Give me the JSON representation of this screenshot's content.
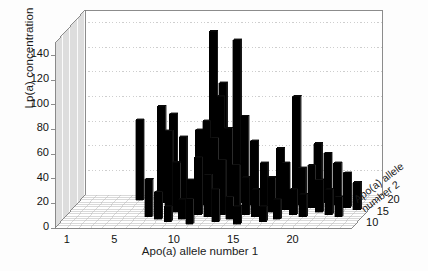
{
  "figure": {
    "type": "3d-bar-chart",
    "background": "#ffffff",
    "bar_color": "#000000",
    "bar_side_color": "#2b2b2b",
    "axis_color": "#808080",
    "grid_color": "#b9b9b9"
  },
  "axes": {
    "y_axis_label": "Lp(a) concentration",
    "x_axis_label": "Apo(a) allele number 1",
    "z_axis_label_line1": "Apo(a) allele",
    "z_axis_label_line2": "number 2",
    "y_ticks": [
      "0",
      "20",
      "40",
      "60",
      "80",
      "100",
      "120",
      "140"
    ],
    "x_ticks": [
      "1",
      "5",
      "10",
      "15",
      "20"
    ],
    "z_ticks": [
      "10",
      "15",
      "20"
    ]
  },
  "chart_data": {
    "type": "bar",
    "title": "",
    "xlabel": "Apo(a) allele number 1",
    "ylabel": "Lp(a) concentration",
    "zlabel": "Apo(a) allele number 2",
    "xlim": [
      0,
      25
    ],
    "ylim": [
      0,
      150
    ],
    "zlim": [
      8,
      22
    ],
    "xticks": [
      1,
      5,
      10,
      15,
      20
    ],
    "yticks": [
      0,
      20,
      40,
      60,
      80,
      100,
      120,
      140
    ],
    "zticks": [
      10,
      15,
      20
    ],
    "grid": true,
    "legend": null,
    "projection": "3d-bar3",
    "categories_x": [
      1,
      2,
      3,
      4,
      5,
      6,
      7,
      8,
      9,
      10,
      11,
      12,
      13,
      14,
      15,
      16,
      17,
      18,
      19,
      20,
      21,
      22,
      23,
      24
    ],
    "categories_z": [
      10,
      11,
      12,
      13,
      14,
      15,
      16,
      17,
      18,
      19,
      20,
      21,
      22
    ],
    "points": [
      {
        "x": 5,
        "z": 20,
        "v": 65
      },
      {
        "x": 7,
        "z": 19,
        "v": 78
      },
      {
        "x": 7,
        "z": 13,
        "v": 30
      },
      {
        "x": 8,
        "z": 19,
        "v": 72
      },
      {
        "x": 8,
        "z": 17,
        "v": 62
      },
      {
        "x": 8,
        "z": 12,
        "v": 22
      },
      {
        "x": 9,
        "z": 18,
        "v": 55
      },
      {
        "x": 9,
        "z": 15,
        "v": 40
      },
      {
        "x": 9,
        "z": 11,
        "v": 12
      },
      {
        "x": 10,
        "z": 20,
        "v": 57
      },
      {
        "x": 10,
        "z": 16,
        "v": 24
      },
      {
        "x": 10,
        "z": 12,
        "v": 16
      },
      {
        "x": 11,
        "z": 21,
        "v": 135
      },
      {
        "x": 11,
        "z": 18,
        "v": 68
      },
      {
        "x": 11,
        "z": 14,
        "v": 46
      },
      {
        "x": 11,
        "z": 10,
        "v": 20
      },
      {
        "x": 12,
        "z": 20,
        "v": 95
      },
      {
        "x": 12,
        "z": 19,
        "v": 86
      },
      {
        "x": 12,
        "z": 16,
        "v": 58
      },
      {
        "x": 12,
        "z": 13,
        "v": 34
      },
      {
        "x": 13,
        "z": 21,
        "v": 128
      },
      {
        "x": 13,
        "z": 17,
        "v": 64
      },
      {
        "x": 13,
        "z": 14,
        "v": 44
      },
      {
        "x": 13,
        "z": 11,
        "v": 26
      },
      {
        "x": 14,
        "z": 19,
        "v": 70
      },
      {
        "x": 14,
        "z": 15,
        "v": 38
      },
      {
        "x": 14,
        "z": 12,
        "v": 18
      },
      {
        "x": 15,
        "z": 18,
        "v": 52
      },
      {
        "x": 15,
        "z": 14,
        "v": 30
      },
      {
        "x": 15,
        "z": 10,
        "v": 14
      },
      {
        "x": 16,
        "z": 17,
        "v": 36
      },
      {
        "x": 16,
        "z": 13,
        "v": 22
      },
      {
        "x": 17,
        "z": 19,
        "v": 44
      },
      {
        "x": 17,
        "z": 15,
        "v": 28
      },
      {
        "x": 17,
        "z": 11,
        "v": 12
      },
      {
        "x": 18,
        "z": 21,
        "v": 82
      },
      {
        "x": 18,
        "z": 16,
        "v": 38
      },
      {
        "x": 18,
        "z": 12,
        "v": 16
      },
      {
        "x": 19,
        "z": 18,
        "v": 30
      },
      {
        "x": 19,
        "z": 14,
        "v": 20
      },
      {
        "x": 20,
        "z": 20,
        "v": 46
      },
      {
        "x": 20,
        "z": 17,
        "v": 34
      },
      {
        "x": 20,
        "z": 13,
        "v": 18
      },
      {
        "x": 21,
        "z": 19,
        "v": 40
      },
      {
        "x": 21,
        "z": 15,
        "v": 26
      },
      {
        "x": 22,
        "z": 18,
        "v": 34
      },
      {
        "x": 22,
        "z": 14,
        "v": 20
      },
      {
        "x": 23,
        "z": 17,
        "v": 28
      },
      {
        "x": 23,
        "z": 13,
        "v": 16
      },
      {
        "x": 24,
        "z": 16,
        "v": 22
      }
    ]
  }
}
